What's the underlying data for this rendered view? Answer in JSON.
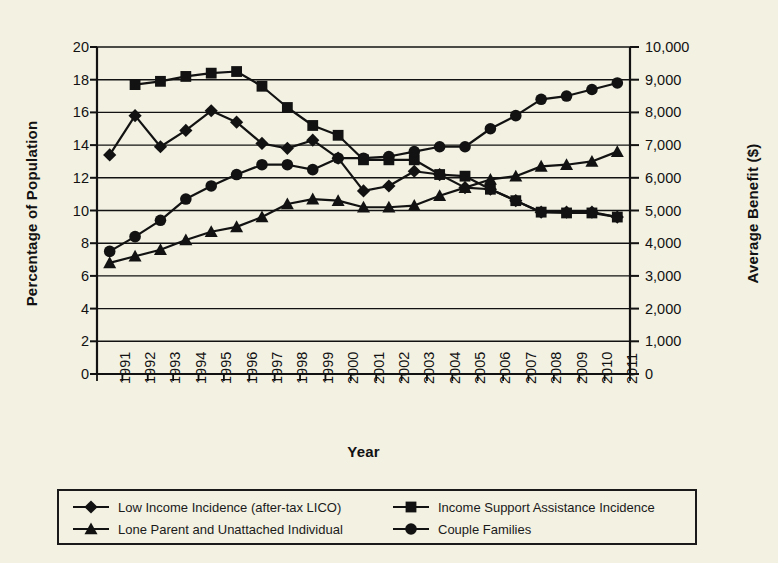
{
  "chart_data": {
    "type": "line",
    "title": "",
    "xlabel": "Year",
    "ylabel": "Percentage of Population",
    "ylabel_secondary": "Average Benefit ($)",
    "categories": [
      "1991",
      "1992",
      "1993",
      "1994",
      "1995",
      "1996",
      "1997",
      "1998",
      "1999",
      "2000",
      "2001",
      "2002",
      "2003",
      "2004",
      "2005",
      "2006",
      "2007",
      "2008",
      "2009",
      "2010",
      "2011"
    ],
    "ylim": [
      0,
      20
    ],
    "ytick_step": 2,
    "yticks": [
      "20",
      "18",
      "16",
      "14",
      "12",
      "10",
      "8",
      "6",
      "4",
      "2",
      "0"
    ],
    "ylim_secondary": [
      0,
      10000
    ],
    "ytick_step_secondary": 1000,
    "yticks_secondary": [
      "10,000",
      "9,000",
      "8,000",
      "7,000",
      "6,000",
      "5,000",
      "4,000",
      "3,000",
      "2,000",
      "1,000",
      "0"
    ],
    "grid": true,
    "grid_axis": "y",
    "legend_position": "bottom",
    "series": [
      {
        "name": "Low Income Incidence (after-tax LICO)",
        "marker": "diamond",
        "axis": "left",
        "values": [
          13.4,
          15.8,
          13.9,
          14.9,
          16.1,
          15.4,
          14.1,
          13.8,
          14.3,
          13.2,
          11.2,
          11.5,
          12.4,
          12.2,
          11.4,
          11.3,
          10.6,
          9.9,
          9.9,
          9.9,
          9.6
        ]
      },
      {
        "name": "Income Support Assistance Incidence",
        "marker": "square",
        "axis": "left",
        "values": [
          null,
          17.7,
          17.9,
          18.2,
          18.4,
          18.5,
          17.6,
          16.3,
          15.2,
          14.6,
          13.1,
          13.1,
          13.1,
          12.2,
          12.1,
          11.3,
          10.6,
          9.9,
          9.85,
          9.85,
          9.6
        ]
      },
      {
        "name": "Lone Parent and Unattached Individual",
        "marker": "triangle",
        "axis": "right",
        "values": [
          3400,
          3600,
          3800,
          4100,
          4350,
          4500,
          4800,
          5200,
          5350,
          5300,
          5100,
          5100,
          5150,
          5450,
          5700,
          5950,
          6050,
          6350,
          6400,
          6500,
          6800
        ]
      },
      {
        "name": "Couple Families",
        "marker": "circle",
        "axis": "right",
        "values": [
          3750,
          4200,
          4700,
          5350,
          5750,
          6100,
          6400,
          6400,
          6250,
          6600,
          6600,
          6650,
          6800,
          6950,
          6950,
          7500,
          7900,
          8400,
          8500,
          8700,
          8900
        ]
      }
    ]
  },
  "legend": {
    "items": [
      {
        "label": "Low Income Incidence (after-tax LICO)",
        "marker": "diamond"
      },
      {
        "label": "Income Support Assistance Incidence",
        "marker": "square"
      },
      {
        "label": "Lone Parent and Unattached Individual",
        "marker": "triangle"
      },
      {
        "label": "Couple Families",
        "marker": "circle"
      }
    ]
  },
  "colors": {
    "background": "#f2f1e2",
    "ink": "#121212",
    "grid": "#1a1a1a"
  }
}
